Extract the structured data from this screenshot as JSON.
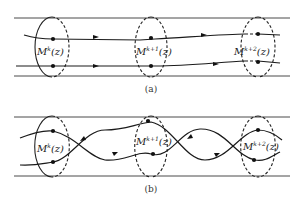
{
  "figure": {
    "panels": [
      {
        "id": "a",
        "caption": "(a)",
        "labels": [
          {
            "base": "M",
            "sup": "k",
            "arg": "(z)"
          },
          {
            "base": "M",
            "sup": "k+1",
            "arg": "(z)"
          },
          {
            "base": "M",
            "sup": "k+2",
            "arg": "(z)"
          }
        ],
        "description": "Two parallel trajectories passing through three consecutive cross-sections"
      },
      {
        "id": "b",
        "caption": "(b)",
        "labels": [
          {
            "base": "M",
            "sup": "k",
            "arg": "(z)"
          },
          {
            "base": "M",
            "sup": "k+1",
            "arg": "(z)"
          },
          {
            "base": "M",
            "sup": "k+2",
            "arg": "(z)"
          }
        ],
        "description": "Two intertwined trajectories crossing between consecutive cross-sections"
      }
    ]
  }
}
